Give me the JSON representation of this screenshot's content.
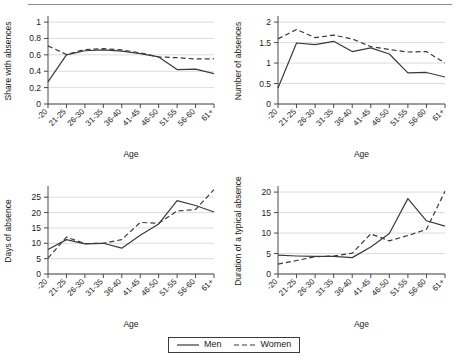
{
  "figure": {
    "legend": {
      "men_label": "Men",
      "women_label": "Women"
    }
  },
  "chart_data": [
    {
      "id": "share-with-absences",
      "type": "line",
      "title": "",
      "xlabel": "Age",
      "ylabel": "Share with absences",
      "categories": [
        "-20",
        "21-25",
        "26-30",
        "31-35",
        "36-40",
        "41-45",
        "46-50",
        "51-55",
        "56-60",
        "61+"
      ],
      "yticks": [
        0,
        0.2,
        0.4,
        0.6,
        0.8,
        1
      ],
      "ytick_labels": [
        "0",
        "0.2",
        "0.4",
        "0.6",
        "0.8",
        "1"
      ],
      "ylim": [
        0,
        1.05
      ],
      "grid": true,
      "legend_position": "figure-bottom",
      "series": [
        {
          "name": "Men",
          "style": "solid",
          "values": [
            0.27,
            0.6,
            0.65,
            0.66,
            0.645,
            0.615,
            0.575,
            0.42,
            0.425,
            0.37
          ]
        },
        {
          "name": "Women",
          "style": "dashed",
          "values": [
            0.71,
            0.605,
            0.665,
            0.675,
            0.66,
            0.625,
            0.575,
            0.565,
            0.55,
            0.55
          ]
        }
      ]
    },
    {
      "id": "number-of-absences",
      "type": "line",
      "title": "",
      "xlabel": "Age",
      "ylabel": "Number of absences",
      "categories": [
        "-20",
        "21-25",
        "26-30",
        "31-35",
        "36-40",
        "41-45",
        "46-50",
        "51-55",
        "56-60",
        "61+"
      ],
      "yticks": [
        0,
        0.5,
        1,
        1.5,
        2
      ],
      "ytick_labels": [
        "0",
        "0.5",
        "1",
        "1.5",
        "2"
      ],
      "ylim": [
        0,
        2.1
      ],
      "grid": true,
      "legend_position": "figure-bottom",
      "series": [
        {
          "name": "Men",
          "style": "solid",
          "values": [
            0.39,
            1.49,
            1.45,
            1.53,
            1.28,
            1.37,
            1.22,
            0.76,
            0.77,
            0.66
          ]
        },
        {
          "name": "Women",
          "style": "dashed",
          "values": [
            1.59,
            1.82,
            1.62,
            1.68,
            1.59,
            1.4,
            1.33,
            1.27,
            1.28,
            1.0
          ]
        }
      ]
    },
    {
      "id": "days-of-absence",
      "type": "line",
      "title": "",
      "xlabel": "Age",
      "ylabel": "Days of absence",
      "categories": [
        "-20",
        "21-25",
        "26-30",
        "31-35",
        "36-40",
        "41-45",
        "46-50",
        "51-55",
        "56-60",
        "61+"
      ],
      "yticks": [
        0,
        5,
        10,
        15,
        20,
        25
      ],
      "ytick_labels": [
        "0",
        "5",
        "10",
        "15",
        "20",
        "25"
      ],
      "ylim": [
        0,
        28
      ],
      "grid": true,
      "legend_position": "figure-bottom",
      "series": [
        {
          "name": "Men",
          "style": "solid",
          "values": [
            8.0,
            11.2,
            9.8,
            10.0,
            8.4,
            12.6,
            16.3,
            23.9,
            22.3,
            20.2
          ]
        },
        {
          "name": "Women",
          "style": "dashed",
          "values": [
            5.2,
            12.0,
            9.9,
            10.0,
            11.2,
            16.8,
            16.5,
            20.5,
            21.0,
            27.5
          ]
        }
      ]
    },
    {
      "id": "duration-of-typical-absence",
      "type": "line",
      "title": "",
      "xlabel": "Age",
      "ylabel": "Duration of a typical absence",
      "categories": [
        "-20",
        "21-25",
        "26-30",
        "31-35",
        "36-40",
        "41-45",
        "46-50",
        "51-55",
        "56-60",
        "61+"
      ],
      "yticks": [
        0,
        5,
        10,
        15,
        20
      ],
      "ytick_labels": [
        "0",
        "5",
        "10",
        "15",
        "20"
      ],
      "ylim": [
        0,
        21
      ],
      "grid": true,
      "legend_position": "figure-bottom",
      "series": [
        {
          "name": "Men",
          "style": "solid",
          "values": [
            4.6,
            4.4,
            4.3,
            4.3,
            4.0,
            6.6,
            9.9,
            18.4,
            13.0,
            11.7
          ]
        },
        {
          "name": "Women",
          "style": "dashed",
          "values": [
            2.4,
            3.3,
            4.2,
            4.4,
            5.1,
            9.8,
            8.1,
            9.4,
            10.9,
            20.2
          ]
        }
      ]
    }
  ]
}
